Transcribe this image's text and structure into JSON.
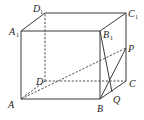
{
  "diagram": {
    "type": "rectangular prism (cuboid) with points P and Q",
    "vertices": {
      "A": {
        "label": "A",
        "sub": "",
        "x": 21,
        "y": 99
      },
      "B": {
        "label": "B",
        "sub": "",
        "x": 100,
        "y": 99
      },
      "C": {
        "label": "C",
        "sub": "",
        "x": 126,
        "y": 81
      },
      "D": {
        "label": "D",
        "sub": "",
        "x": 45,
        "y": 81
      },
      "A1": {
        "label": "A",
        "sub": "1",
        "x": 21,
        "y": 31
      },
      "B1": {
        "label": "B",
        "sub": "1",
        "x": 100,
        "y": 31
      },
      "C1": {
        "label": "C",
        "sub": "1",
        "x": 126,
        "y": 13
      },
      "D1": {
        "label": "D",
        "sub": "1",
        "x": 45,
        "y": 13
      },
      "P": {
        "label": "P",
        "sub": "",
        "x": 126,
        "y": 48
      },
      "Q": {
        "label": "Q",
        "sub": "",
        "x": 112,
        "y": 92
      }
    },
    "solid_edges": [
      "A-B",
      "B-C",
      "A-A1",
      "B-B1",
      "C-C1",
      "A1-B1",
      "B1-C1",
      "C1-D1",
      "D1-A1",
      "B1-Q",
      "B-P"
    ],
    "dashed_edges": [
      "D-A",
      "D-C",
      "D-D1",
      "A-P"
    ],
    "labels": {
      "A": "A",
      "B": "B",
      "C": "C",
      "D": "D",
      "A1": "A",
      "A1_sub": "1",
      "B1": "B",
      "B1_sub": "1",
      "C1": "C",
      "C1_sub": "1",
      "D1": "D",
      "D1_sub": "1",
      "P": "P",
      "Q": "Q"
    }
  }
}
